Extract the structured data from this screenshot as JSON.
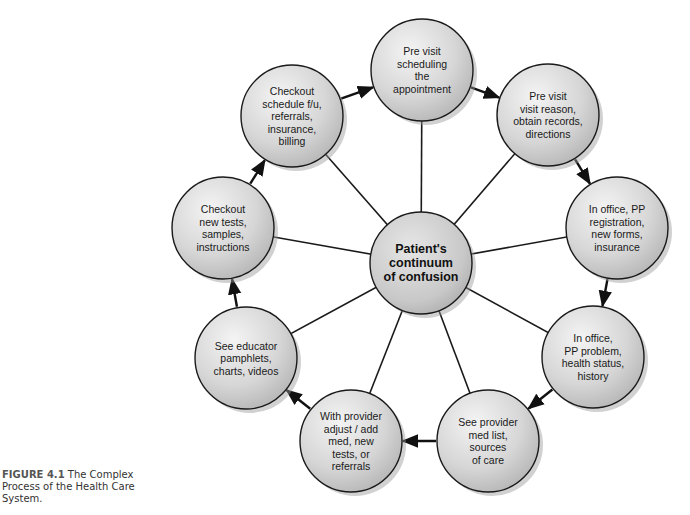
{
  "diagram": {
    "center": {
      "lines": [
        "Patient's",
        "continuum",
        "of confusion"
      ],
      "cx": 421,
      "cy": 263
    },
    "nodes": [
      {
        "id": "pre-visit-scheduling",
        "lines": [
          "Pre visit",
          "scheduling",
          "the",
          "appointment"
        ],
        "cx": 422,
        "cy": 70
      },
      {
        "id": "pre-visit-reason",
        "lines": [
          "Pre visit",
          "visit reason,",
          "obtain records,",
          "directions"
        ],
        "cx": 548,
        "cy": 115
      },
      {
        "id": "in-office-registration",
        "lines": [
          "In office, PP",
          "registration,",
          "new forms,",
          "insurance"
        ],
        "cx": 617,
        "cy": 228
      },
      {
        "id": "in-office-problem",
        "lines": [
          "In office,",
          "PP problem,",
          "health status,",
          "history"
        ],
        "cx": 593,
        "cy": 357
      },
      {
        "id": "see-provider",
        "lines": [
          "See provider",
          "med list,",
          "sources",
          "of care"
        ],
        "cx": 488,
        "cy": 441
      },
      {
        "id": "with-provider",
        "lines": [
          "With provider",
          "adjust / add",
          "med, new",
          "tests, or",
          "referrals"
        ],
        "cx": 351,
        "cy": 441
      },
      {
        "id": "see-educator",
        "lines": [
          "See educator",
          "pamphlets,",
          "charts, videos"
        ],
        "cx": 246,
        "cy": 358
      },
      {
        "id": "checkout-new-tests",
        "lines": [
          "Checkout",
          "new tests,",
          "samples,",
          "instructions"
        ],
        "cx": 223,
        "cy": 228
      },
      {
        "id": "checkout-schedule",
        "lines": [
          "Checkout",
          "schedule f/u,",
          "referrals,",
          "insurance,",
          "billing"
        ],
        "cx": 292,
        "cy": 116
      }
    ],
    "radius": 51,
    "flow_order": [
      "pre-visit-scheduling",
      "pre-visit-reason",
      "in-office-registration",
      "in-office-problem",
      "see-provider",
      "with-provider",
      "see-educator",
      "checkout-new-tests",
      "checkout-schedule",
      "pre-visit-scheduling"
    ],
    "colors": {
      "fill_light": "#f2f2f2",
      "fill_dark": "#b8b8b8",
      "stroke": "#1a1a1a",
      "shadow": "#9a9a9a",
      "arrow": "#111111"
    }
  },
  "caption": {
    "figure_label": "FIGURE 4.1",
    "text": " The Complex Process of the Health Care System."
  }
}
